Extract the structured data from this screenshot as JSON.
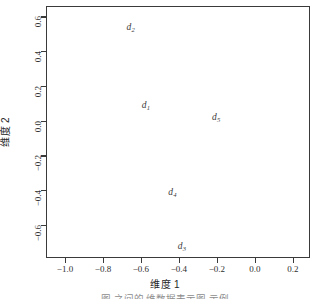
{
  "figure": {
    "caption": "图        之间的  维数据表示图      示例"
  },
  "axes": {
    "xlabel": "维度 1",
    "ylabel": "维度 2",
    "x_ticklabels": [
      "-1.0",
      "-0.8",
      "-0.6",
      "-0.4",
      "-0.2",
      "0.0",
      "0.2"
    ],
    "y_ticklabels": [
      "0.6",
      "0.4",
      "0.2",
      "0.0",
      "-0.2",
      "-0.4",
      "-0.6"
    ]
  },
  "chart_data": {
    "type": "scatter",
    "title": "",
    "xlabel": "维度 1",
    "ylabel": "维度 2",
    "xlim": [
      -1.1,
      0.29
    ],
    "ylim": [
      -0.79,
      0.66
    ],
    "xticks": [
      -1.0,
      -0.8,
      -0.6,
      -0.4,
      -0.2,
      0.0,
      0.2
    ],
    "yticks": [
      0.6,
      0.4,
      0.2,
      0.0,
      -0.2,
      -0.4,
      -0.6
    ],
    "grid": false,
    "legend": false,
    "marker": "text-label",
    "points": [
      {
        "label": "d",
        "subscript": "2",
        "x": -0.66,
        "y": 0.54
      },
      {
        "label": "d",
        "subscript": "1",
        "x": -0.58,
        "y": 0.09
      },
      {
        "label": "d",
        "subscript": "5",
        "x": -0.21,
        "y": 0.02
      },
      {
        "label": "d",
        "subscript": "4",
        "x": -0.44,
        "y": -0.41
      },
      {
        "label": "d",
        "subscript": "3",
        "x": -0.39,
        "y": -0.72
      }
    ]
  },
  "colors": {
    "frame": "#3a3a3a",
    "text": "#2b2b2b",
    "background": "#ffffff"
  }
}
